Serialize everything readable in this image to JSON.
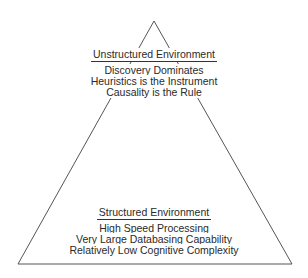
{
  "diagram": {
    "type": "pyramid",
    "top_section": {
      "heading": "Unstructured Environment",
      "lines": [
        "Discovery Dominates",
        "Heuristics is the Instrument",
        "Causality is the Rule"
      ]
    },
    "bottom_section": {
      "heading": "Structured Environment",
      "lines": [
        "High Speed Processing",
        "Very Large Databasing Capability",
        "Relatively Low Cognitive Complexity"
      ]
    },
    "colors": {
      "stroke": "#555555",
      "text": "#2a2a2a",
      "background": "#ffffff"
    }
  }
}
